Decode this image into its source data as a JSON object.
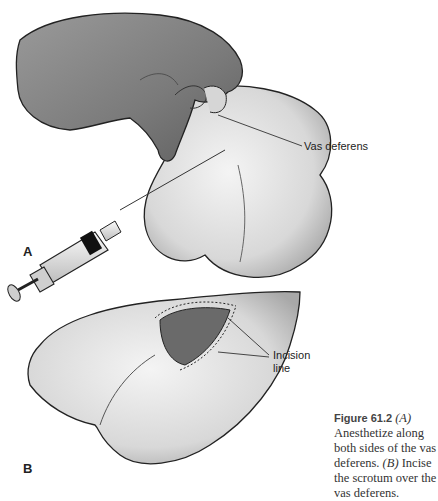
{
  "figure": {
    "panel_a": {
      "letter": "A",
      "callout": "Vas deferens"
    },
    "panel_b": {
      "letter": "B",
      "callout_line1": "Incision",
      "callout_line2": "line"
    },
    "caption": {
      "number": "Figure 61.2",
      "part_a_tag": "(A)",
      "part_a_text": " Anesthetize along both sides of the vas deferens. ",
      "part_b_tag": "(B)",
      "part_b_text": " Incise the scrotum over the vas deferens."
    }
  }
}
